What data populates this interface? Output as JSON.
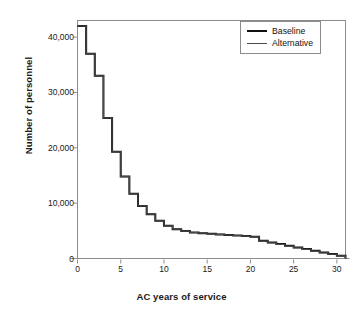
{
  "chart_data": {
    "type": "line",
    "subtype": "step",
    "title": "",
    "xlabel": "AC years of service",
    "ylabel": "Number of personnel",
    "xlim": [
      0,
      31
    ],
    "ylim": [
      0,
      43000
    ],
    "xticks": [
      0,
      5,
      10,
      15,
      20,
      25,
      30
    ],
    "xtick_labels": [
      "0",
      "5",
      "10",
      "15",
      "20",
      "25",
      "30"
    ],
    "yticks": [
      0,
      10000,
      20000,
      30000,
      40000
    ],
    "ytick_labels": [
      "0",
      "10,000",
      "20,000",
      "30,000",
      "40,000"
    ],
    "grid": false,
    "legend_position": "top-right",
    "x": [
      0,
      1,
      2,
      3,
      4,
      5,
      6,
      7,
      8,
      9,
      10,
      11,
      12,
      13,
      14,
      15,
      16,
      17,
      18,
      19,
      20,
      21,
      22,
      23,
      24,
      25,
      26,
      27,
      28,
      29,
      30
    ],
    "series": [
      {
        "name": "Baseline",
        "color": "#111111",
        "line_width": 2,
        "values": [
          42000,
          37000,
          33000,
          25400,
          19300,
          14800,
          11700,
          9500,
          8000,
          6800,
          5900,
          5300,
          4950,
          4700,
          4550,
          4450,
          4350,
          4250,
          4150,
          4050,
          3950,
          3200,
          2900,
          2600,
          2300,
          2000,
          1700,
          1400,
          1100,
          800,
          500
        ]
      },
      {
        "name": "Alternative",
        "color": "#4a4a4a",
        "line_width": 1.1,
        "values": [
          42000,
          37000,
          33000,
          25400,
          19300,
          14800,
          11700,
          9500,
          8000,
          6800,
          5900,
          5300,
          4950,
          4700,
          4550,
          4450,
          4350,
          4250,
          4150,
          4050,
          3900,
          3150,
          2850,
          2550,
          2250,
          1950,
          1650,
          1350,
          1050,
          760,
          470
        ]
      }
    ]
  },
  "legend": {
    "entries": [
      {
        "label": "Baseline"
      },
      {
        "label": "Alternative"
      }
    ]
  },
  "colors": {
    "baseline": "#111111",
    "alternative": "#4a4a4a",
    "frame": "#8c8c8c",
    "text": "#1a1a1a",
    "background": "#ffffff"
  }
}
